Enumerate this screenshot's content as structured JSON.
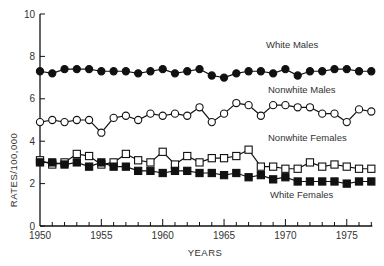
{
  "chart_data": {
    "type": "line",
    "title": "",
    "xlabel": "YEARS",
    "ylabel": "RATES/100,000",
    "xlim": [
      1950,
      1977
    ],
    "ylim": [
      0,
      10
    ],
    "grid": false,
    "legend_position": "inline labels",
    "x_ticks": [
      1950,
      1955,
      1960,
      1965,
      1970,
      1975
    ],
    "y_ticks": [
      0,
      2,
      4,
      6,
      8,
      10
    ],
    "x": [
      1950,
      1951,
      1952,
      1953,
      1954,
      1955,
      1956,
      1957,
      1958,
      1959,
      1960,
      1961,
      1962,
      1963,
      1964,
      1965,
      1966,
      1967,
      1968,
      1969,
      1970,
      1971,
      1972,
      1973,
      1974,
      1975,
      1976,
      1977
    ],
    "series": [
      {
        "name": "White Males",
        "marker": "filled-circle",
        "label_pos": {
          "x": 266,
          "y": 48
        },
        "values": [
          7.3,
          7.2,
          7.4,
          7.4,
          7.4,
          7.3,
          7.3,
          7.3,
          7.2,
          7.3,
          7.4,
          7.2,
          7.3,
          7.4,
          7.1,
          7.0,
          7.2,
          7.3,
          7.3,
          7.2,
          7.4,
          7.1,
          7.3,
          7.3,
          7.4,
          7.4,
          7.3,
          7.3
        ]
      },
      {
        "name": "Nonwhite Males",
        "marker": "open-circle",
        "label_pos": {
          "x": 268,
          "y": 93
        },
        "values": [
          4.9,
          5.0,
          4.9,
          5.0,
          5.0,
          4.4,
          5.1,
          5.2,
          5.0,
          5.3,
          5.2,
          5.3,
          5.2,
          5.6,
          4.9,
          5.3,
          5.8,
          5.7,
          5.2,
          5.7,
          5.7,
          5.6,
          5.6,
          5.3,
          5.3,
          4.9,
          5.5,
          5.4
        ]
      },
      {
        "name": "Nonwhite Females",
        "marker": "open-square",
        "label_pos": {
          "x": 268,
          "y": 141
        },
        "values": [
          3.1,
          2.9,
          3.0,
          3.4,
          3.3,
          2.9,
          3.0,
          3.4,
          3.1,
          3.0,
          3.5,
          2.9,
          3.3,
          3.0,
          3.2,
          3.2,
          3.3,
          3.6,
          2.8,
          2.8,
          2.7,
          2.7,
          3.0,
          2.8,
          2.9,
          2.8,
          2.7,
          2.7
        ]
      },
      {
        "name": "White Females",
        "marker": "filled-square",
        "label_pos": {
          "x": 270,
          "y": 198
        },
        "values": [
          3.0,
          3.0,
          2.9,
          3.0,
          2.8,
          3.0,
          2.8,
          2.8,
          2.6,
          2.6,
          2.5,
          2.6,
          2.6,
          2.5,
          2.5,
          2.4,
          2.5,
          2.3,
          2.4,
          2.2,
          2.3,
          2.1,
          2.1,
          2.1,
          2.1,
          2.0,
          2.1,
          2.1
        ]
      }
    ]
  },
  "colors": {
    "ink": "#111111",
    "background": "#ffffff"
  }
}
